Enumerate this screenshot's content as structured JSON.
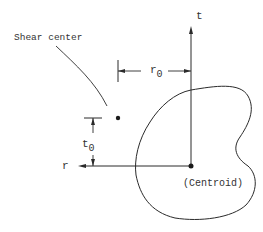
{
  "diagram": {
    "type": "shear-center-geometry",
    "labels": {
      "shear_center": "Shear center",
      "t_axis": "t",
      "r_axis": "r",
      "r0_main": "r",
      "r0_sub": "0",
      "t0_main": "t",
      "t0_sub": "0",
      "centroid": "(Centroid)"
    },
    "colors": {
      "stroke": "#2a2a2a",
      "text": "#333333",
      "background": "#ffffff"
    }
  }
}
